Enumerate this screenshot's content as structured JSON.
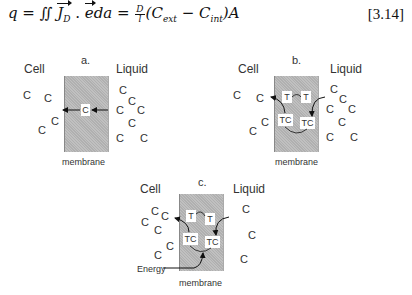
{
  "equation": {
    "lhs": "q = ∬ ",
    "vector_j": "J",
    "vector_j_sub": "D",
    "middle": " . ",
    "vector_e": "e",
    "tail": "da = ",
    "frac_num": "D",
    "frac_den": "l",
    "rhs_open": "(C",
    "sub_ext": "ext",
    "rhs_minus": " − C",
    "sub_int": "int",
    "rhs_close": ")A",
    "number": "[3.14]"
  },
  "panels": {
    "a": {
      "letter": "a.",
      "cell_label": "Cell",
      "liquid_label": "Liquid",
      "membrane_label": "membrane",
      "carrier_symbol": "C",
      "solute": "C"
    },
    "b": {
      "letter": "b.",
      "cell_label": "Cell",
      "liquid_label": "Liquid",
      "membrane_label": "membrane",
      "transporter": "T",
      "complex": "TC",
      "solute": "C"
    },
    "c": {
      "letter": "c.",
      "cell_label": "Cell",
      "liquid_label": "Liquid",
      "membrane_label": "membrane",
      "transporter": "T",
      "complex": "TC",
      "solute": "C",
      "energy_label": "Energy"
    }
  },
  "colors": {
    "membrane": "#b9b9b9",
    "text": "#333333",
    "arrow": "#111111"
  }
}
